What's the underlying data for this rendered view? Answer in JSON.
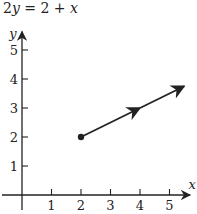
{
  "chart_data": {
    "type": "line",
    "title": "2y = 2 + x",
    "xlabel": "x",
    "ylabel": "y",
    "xlim": [
      0,
      5.7
    ],
    "ylim": [
      0,
      5.5
    ],
    "xticks": [
      1,
      2,
      3,
      4,
      5
    ],
    "yticks": [
      1,
      2,
      3,
      4,
      5
    ],
    "xtick_labels": [
      "1",
      "2",
      "3",
      "4",
      "5"
    ],
    "ytick_labels": [
      "1",
      "2",
      "3",
      "4",
      "5"
    ],
    "grid": false,
    "series": [
      {
        "name": "2y = 2 + x (ray)",
        "start_point": {
          "x": 2,
          "y": 2,
          "marker": "filled-dot"
        },
        "end": {
          "x": 5.5,
          "y": 3.75,
          "marker": "arrowhead"
        },
        "mid_arrow_at": {
          "x": 4,
          "y": 3
        }
      }
    ],
    "colors": {
      "ink": "#222222",
      "background": "#ffffff"
    }
  }
}
